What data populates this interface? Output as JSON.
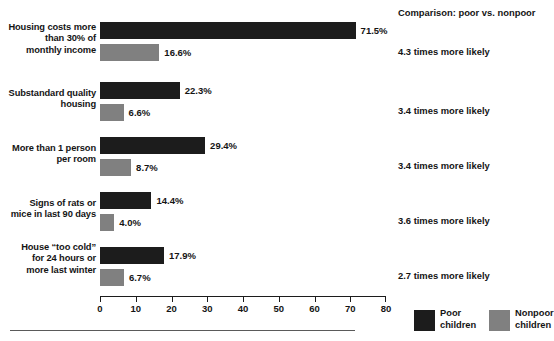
{
  "chart_data": {
    "type": "bar",
    "orientation": "horizontal",
    "title": "",
    "xlabel": "",
    "ylabel": "",
    "xlim": [
      0,
      80
    ],
    "xticks": [
      0,
      10,
      20,
      30,
      40,
      50,
      60,
      70,
      80
    ],
    "grid": false,
    "legend_position": "bottom-right",
    "categories": [
      "Housing costs more\nthan 30% of\nmonthly income",
      "Substandard quality\nhousing",
      "More than 1 person\nper room",
      "Signs of rats or\nmice in last 90 days",
      "House “too cold”\nfor 24 hours or\nmore last winter"
    ],
    "series": [
      {
        "name": "Poor\nchildren",
        "color": "#1c1c1c",
        "values": [
          71.5,
          22.3,
          29.4,
          14.4,
          17.9
        ],
        "labels": [
          "71.5%",
          "22.3%",
          "29.4%",
          "14.4%",
          "17.9%"
        ]
      },
      {
        "name": "Nonpoor\nchildren",
        "color": "#808080",
        "values": [
          16.6,
          6.6,
          8.7,
          4.0,
          6.7
        ],
        "labels": [
          "16.6%",
          "6.6%",
          "8.7%",
          "4.0%",
          "6.7%"
        ]
      }
    ],
    "annotations": {
      "header": "Comparison: poor vs. nonpoor",
      "items": [
        "4.3 times more likely",
        "3.4 times more likely",
        "3.4 times more likely",
        "3.6 times more likely",
        "2.7 times more likely"
      ]
    },
    "axis_tick_labels": [
      "0",
      "10",
      "20",
      "30",
      "40",
      "50",
      "60",
      "70",
      "80"
    ]
  }
}
